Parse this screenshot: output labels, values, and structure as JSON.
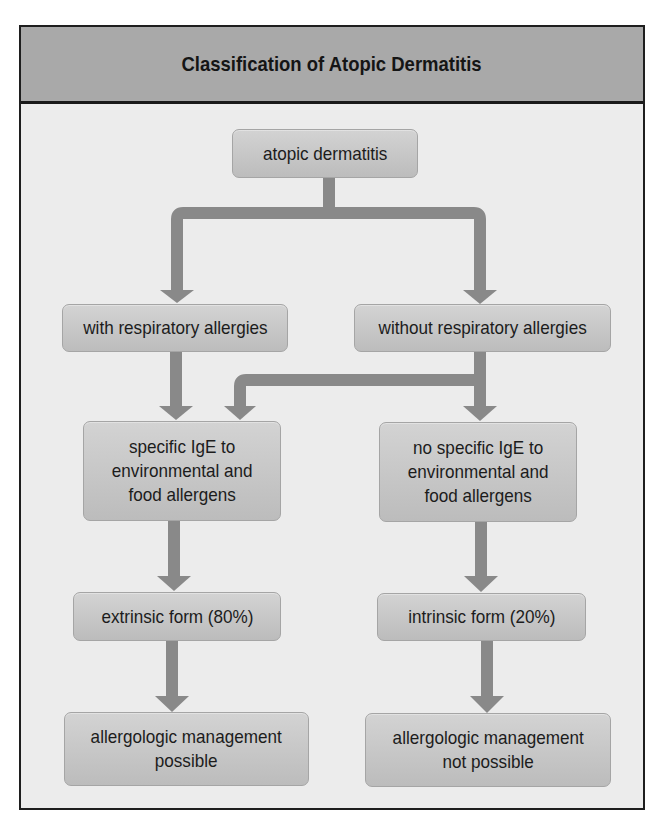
{
  "title": "Classification of Atopic Dermatitis",
  "colors": {
    "header_bg": "#a9a9a9",
    "body_bg": "#ececec",
    "node_top": "#d3d3d3",
    "node_bottom": "#bcbcbc",
    "arrow": "#898989",
    "border": "#1e1e1e"
  },
  "nodes": {
    "root": "atopic dermatitis",
    "with_resp": "with respiratory allergies",
    "without_resp": "without respiratory allergies",
    "specific_ige": "specific IgE to\nenvironmental and\nfood allergens",
    "no_specific_ige": "no specific IgE to\nenvironmental and\nfood allergens",
    "extrinsic": "extrinsic form (80%)",
    "intrinsic": "intrinsic form (20%)",
    "mgmt_possible": "allergologic management\npossible",
    "mgmt_not_possible": "allergologic management\nnot possible"
  },
  "edges": [
    {
      "from": "atopic dermatitis",
      "to": "with respiratory allergies"
    },
    {
      "from": "atopic dermatitis",
      "to": "without respiratory allergies"
    },
    {
      "from": "with respiratory allergies",
      "to": "specific IgE to environmental and food allergens"
    },
    {
      "from": "without respiratory allergies",
      "to": "specific IgE to environmental and food allergens"
    },
    {
      "from": "without respiratory allergies",
      "to": "no specific IgE to environmental and food allergens"
    },
    {
      "from": "specific IgE to environmental and food allergens",
      "to": "extrinsic form (80%)"
    },
    {
      "from": "no specific IgE to environmental and food allergens",
      "to": "intrinsic form (20%)"
    },
    {
      "from": "extrinsic form (80%)",
      "to": "allergologic management possible"
    },
    {
      "from": "intrinsic form (20%)",
      "to": "allergologic management not possible"
    }
  ]
}
